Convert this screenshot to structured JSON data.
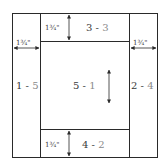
{
  "diagram": {
    "dimension_label": "1¾\"",
    "pieces": [
      {
        "id": "left",
        "main": "1",
        "sep": " - ",
        "sub": "5"
      },
      {
        "id": "right",
        "main": "2",
        "sep": " - ",
        "sub": "4"
      },
      {
        "id": "top",
        "main": "3",
        "sep": " - ",
        "sub": "3"
      },
      {
        "id": "bottom",
        "main": "4",
        "sep": " - ",
        "sub": "2"
      },
      {
        "id": "center",
        "main": "5",
        "sep": " - ",
        "sub": "1"
      }
    ],
    "colors": {
      "line": "#2a2a2a",
      "text": "#3a3a3a",
      "text_secondary": "#8a8a8a"
    }
  }
}
